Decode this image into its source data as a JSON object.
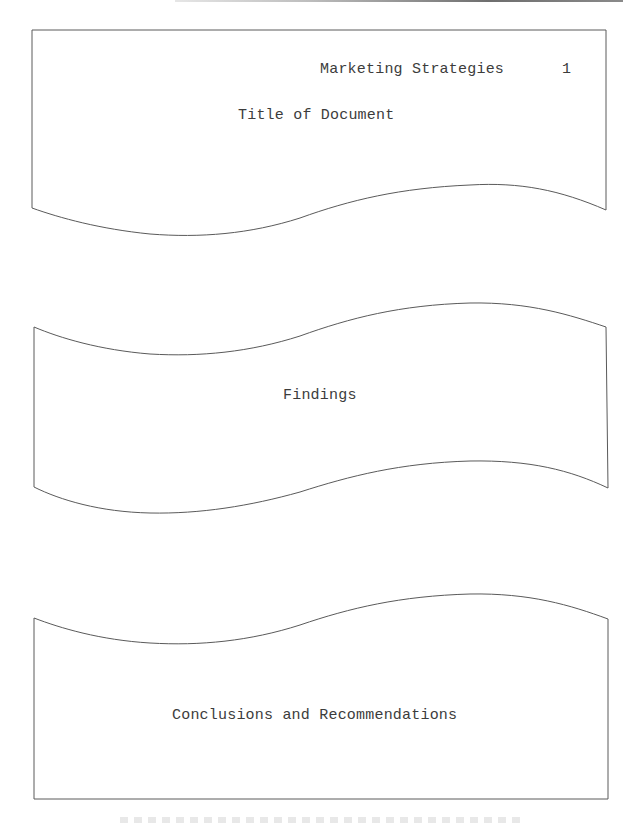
{
  "document": {
    "running_header": "Marketing Strategies",
    "page_number": "1"
  },
  "sections": [
    {
      "id": "title",
      "label": "Title of Document"
    },
    {
      "id": "findings",
      "label": "Findings"
    },
    {
      "id": "conclusions",
      "label": "Conclusions and Recommendations"
    }
  ],
  "colors": {
    "stroke": "#5a5a5a",
    "text": "#3c3c3c",
    "background": "#ffffff"
  }
}
